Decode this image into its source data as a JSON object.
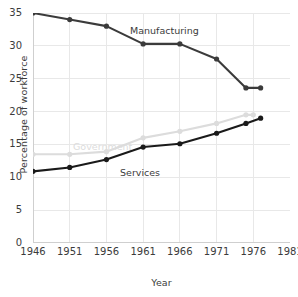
{
  "chart_data": {
    "type": "line",
    "title": "",
    "xlabel": "Year",
    "ylabel": "Percentage of workforce",
    "xlim": [
      1946,
      1981
    ],
    "ylim": [
      0,
      35
    ],
    "xticks": [
      1946,
      1951,
      1956,
      1961,
      1966,
      1971,
      1976,
      1981
    ],
    "yticks": [
      0,
      5,
      10,
      15,
      20,
      25,
      30,
      35
    ],
    "grid": true,
    "legend_position": "inline-annotations",
    "series": [
      {
        "name": "Manufacturing",
        "color": "#3b3b3b",
        "x": [
          1946,
          1951,
          1956,
          1961,
          1966,
          1971,
          1975,
          1977
        ],
        "values": [
          35.0,
          34.0,
          33.0,
          30.3,
          30.3,
          28.0,
          23.6,
          23.6
        ]
      },
      {
        "name": "Government",
        "color": "#dcdcdc",
        "x": [
          1946,
          1951,
          1956,
          1961,
          1966,
          1971,
          1975,
          1976
        ],
        "values": [
          13.5,
          13.5,
          13.9,
          16.0,
          17.0,
          18.2,
          19.5,
          19.5
        ]
      },
      {
        "name": "Services",
        "color": "#1a1a1a",
        "x": [
          1946,
          1951,
          1956,
          1961,
          1966,
          1971,
          1975,
          1977
        ],
        "values": [
          10.9,
          11.5,
          12.7,
          14.6,
          15.1,
          16.7,
          18.2,
          19.0
        ]
      }
    ],
    "annotations": [
      {
        "text": "Manufacturing",
        "series": "Manufacturing"
      },
      {
        "text": "Services",
        "series": "Services"
      },
      {
        "text": "Government",
        "series": "Government"
      }
    ],
    "colors": {
      "manufacturing": "#3b3b3b",
      "services": "#1a1a1a",
      "government": "#dcdcdc",
      "grid": "#e8e8e8",
      "axis": "#cfcfcf",
      "text": "#3b3b3b"
    }
  }
}
